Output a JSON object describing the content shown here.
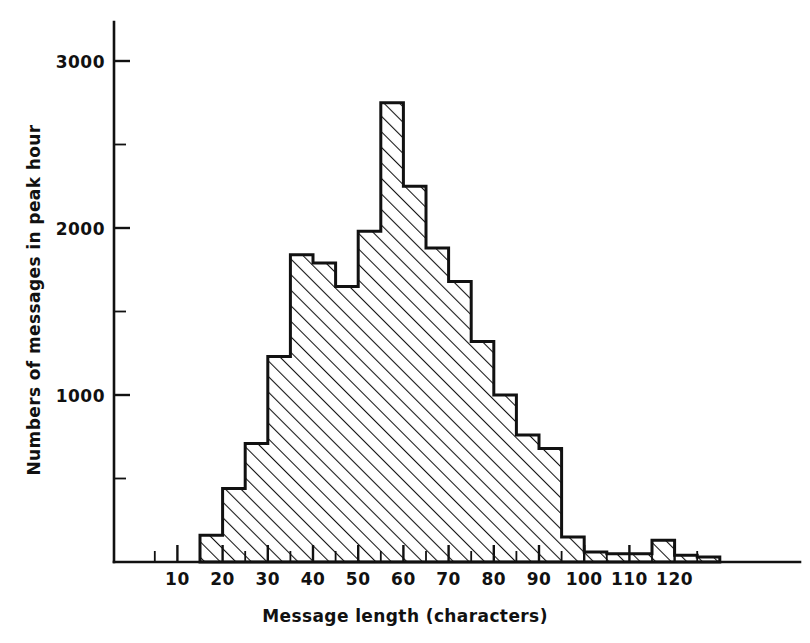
{
  "chart_data": {
    "type": "bar",
    "title": "",
    "subtitle": "",
    "xlabel": "Message length (characters)",
    "ylabel": "Numbers of messages in peak hour",
    "xlim": [
      5,
      130
    ],
    "ylim": [
      0,
      3000
    ],
    "grid": false,
    "legend": null,
    "bin_width": 5,
    "x_major_ticks": [
      10,
      20,
      30,
      40,
      50,
      60,
      70,
      80,
      90,
      100,
      110,
      120
    ],
    "x_major_tick_labels": [
      "10",
      "20",
      "30",
      "40",
      "50",
      "60",
      "70",
      "80",
      "90",
      "100",
      "110",
      "120"
    ],
    "x_minor_ticks": [
      5,
      15,
      25,
      35,
      45,
      55,
      65,
      75,
      85,
      95,
      105,
      115,
      125
    ],
    "y_major_ticks": [
      1000,
      2000,
      3000
    ],
    "y_major_tick_labels": [
      "1000",
      "2000",
      "3000"
    ],
    "y_minor_ticks": [
      500,
      1500,
      2500
    ],
    "bins": [
      {
        "start": 15,
        "end": 20,
        "value": 160
      },
      {
        "start": 20,
        "end": 25,
        "value": 440
      },
      {
        "start": 25,
        "end": 30,
        "value": 710
      },
      {
        "start": 30,
        "end": 35,
        "value": 1230
      },
      {
        "start": 35,
        "end": 40,
        "value": 1840
      },
      {
        "start": 40,
        "end": 45,
        "value": 1790
      },
      {
        "start": 45,
        "end": 50,
        "value": 1650
      },
      {
        "start": 50,
        "end": 55,
        "value": 1980
      },
      {
        "start": 55,
        "end": 60,
        "value": 2750
      },
      {
        "start": 60,
        "end": 65,
        "value": 2250
      },
      {
        "start": 65,
        "end": 70,
        "value": 1880
      },
      {
        "start": 70,
        "end": 75,
        "value": 1680
      },
      {
        "start": 75,
        "end": 80,
        "value": 1320
      },
      {
        "start": 80,
        "end": 85,
        "value": 1000
      },
      {
        "start": 85,
        "end": 90,
        "value": 760
      },
      {
        "start": 90,
        "end": 95,
        "value": 680
      },
      {
        "start": 95,
        "end": 100,
        "value": 150
      },
      {
        "start": 100,
        "end": 105,
        "value": 60
      },
      {
        "start": 105,
        "end": 110,
        "value": 50
      },
      {
        "start": 110,
        "end": 115,
        "value": 50
      },
      {
        "start": 115,
        "end": 120,
        "value": 130
      },
      {
        "start": 120,
        "end": 125,
        "value": 40
      },
      {
        "start": 125,
        "end": 130,
        "value": 30
      }
    ],
    "categories": [
      "15-20",
      "20-25",
      "25-30",
      "30-35",
      "35-40",
      "40-45",
      "45-50",
      "50-55",
      "55-60",
      "60-65",
      "65-70",
      "70-75",
      "75-80",
      "80-85",
      "85-90",
      "90-95",
      "95-100",
      "100-105",
      "105-110",
      "110-115",
      "115-120",
      "120-125",
      "125-130"
    ],
    "values": [
      160,
      440,
      710,
      1230,
      1840,
      1790,
      1650,
      1980,
      2750,
      2250,
      1880,
      1680,
      1320,
      1000,
      760,
      680,
      150,
      60,
      50,
      50,
      130,
      40,
      30
    ],
    "style": {
      "fill_pattern": "diagonal-hatch",
      "line_color": "#111111",
      "background": "#ffffff"
    }
  }
}
